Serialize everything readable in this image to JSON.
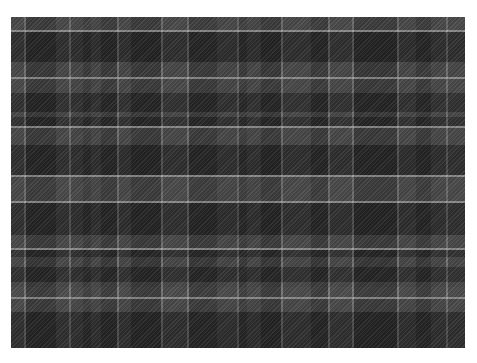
{
  "image": {
    "subject": "grey tartan plaid fabric",
    "palette": {
      "base": "#3a3a3a",
      "dark": "#1f1f1f",
      "mid": "#4d4d4d",
      "light_mid": "#5c5c5c",
      "line": "#a8a8a8"
    }
  }
}
